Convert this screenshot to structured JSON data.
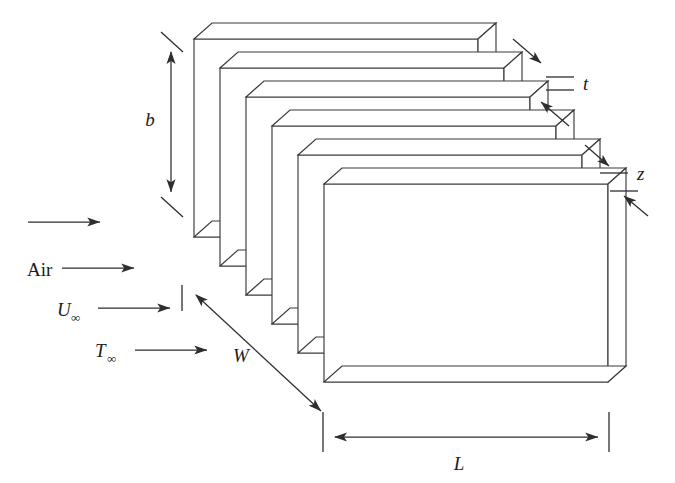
{
  "figure": {
    "type": "engineering-schematic",
    "background_color": "#ffffff",
    "line_color": "#3a3a3a",
    "text_color": "#1c1c1c"
  },
  "labels": {
    "fluid": "Air",
    "velocity": "U",
    "velocity_sub": "∞",
    "temperature": "T",
    "temperature_sub": "∞",
    "height": "b",
    "width": "W",
    "length": "L",
    "thickness": "t",
    "spacing": "z"
  },
  "dimensions": [
    {
      "name": "height",
      "symbol": "b",
      "orientation": "vertical",
      "label_x": 150,
      "label_y": 126
    },
    {
      "name": "width",
      "symbol": "W",
      "orientation": "diagonal",
      "label_x": 241,
      "label_y": 362
    },
    {
      "name": "length",
      "symbol": "L",
      "orientation": "horizontal",
      "label_x": 459,
      "label_y": 470
    },
    {
      "name": "thickness",
      "symbol": "t",
      "orientation": "callout",
      "label_x": 583,
      "label_y": 86
    },
    {
      "name": "spacing",
      "symbol": "z",
      "orientation": "callout",
      "label_x": 637,
      "label_y": 178
    }
  ],
  "flow_arrows": [
    {
      "x1": 28,
      "y1": 222,
      "x2": 100,
      "y2": 222
    },
    {
      "x1": 62,
      "y1": 268,
      "x2": 134,
      "y2": 268
    },
    {
      "x1": 98,
      "y1": 308,
      "x2": 170,
      "y2": 308
    },
    {
      "x1": 135,
      "y1": 350,
      "x2": 207,
      "y2": 350
    }
  ],
  "plates": {
    "count": 6,
    "offset_x": 26,
    "offset_y": 29,
    "plate_width": 284,
    "plate_height": 198,
    "thickness": 9,
    "depth_dx": 18,
    "depth_dy": -16,
    "front_origin_x": 324,
    "front_origin_y": 210
  },
  "text_annotations": [
    {
      "name": "fluid-label",
      "text": "Air",
      "x": 27,
      "y": 276,
      "style": "roman",
      "size": 19
    },
    {
      "name": "velocity-label",
      "text": "U",
      "x": 57,
      "y": 316,
      "style": "italic",
      "size": 19
    },
    {
      "name": "temperature-label",
      "text": "T",
      "x": 95,
      "y": 357,
      "style": "italic",
      "size": 19
    }
  ]
}
